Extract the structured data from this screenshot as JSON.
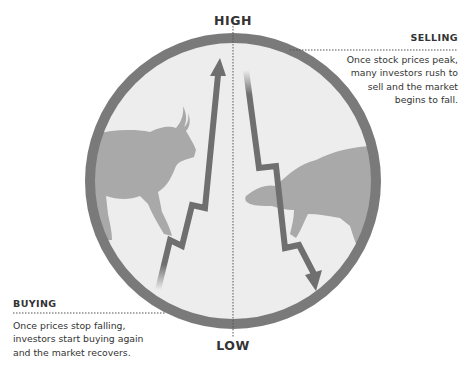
{
  "diagram": {
    "title_top": "HIGH",
    "title_bottom": "LOW",
    "colors": {
      "ring": "#7a7a7a",
      "fill": "#ededed",
      "animal": "#a9a9a9",
      "arrow": "#6f6f6f",
      "text": "#333333"
    },
    "icons": {
      "bull": "bull-silhouette",
      "bear": "bear-silhouette",
      "up_arrow": "zigzag-up-arrow",
      "down_arrow": "zigzag-down-arrow"
    }
  },
  "callouts": {
    "selling": {
      "title": "SELLING",
      "lines": [
        "Once stock prices peak,",
        "many investors rush to",
        "sell and the market",
        "begins to fall."
      ]
    },
    "buying": {
      "title": "BUYING",
      "lines": [
        "Once prices stop falling,",
        "investors start buying again",
        "and the market recovers."
      ]
    }
  }
}
